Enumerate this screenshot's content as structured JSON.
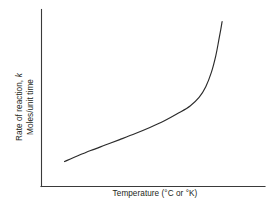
{
  "chart_data": {
    "type": "line",
    "title": "",
    "subtitle": "",
    "xlabel": "Temperature (°C or °K)",
    "ylabel_line1": "Rate of reaction, k",
    "ylabel_line1_plain": "Rate of reaction,",
    "ylabel_line1_symbol": "k",
    "ylabel_line2": "Moles/unit time",
    "ylabel_full": "Rate of reaction, k  Moles/unit time",
    "grid": false,
    "legend": "none",
    "xlim": [
      0,
      100
    ],
    "ylim": [
      0,
      100
    ],
    "xticks": [],
    "yticks": [],
    "xtick_labels": [],
    "ytick_labels": [],
    "annotations": [],
    "series": [
      {
        "name": "Rate of reaction vs temperature",
        "color": "#2b2b2b",
        "x": [
          10.3,
          16.0,
          22.0,
          28.5,
          35.0,
          42.0,
          48.5,
          55.0,
          61.5,
          66.5,
          70.5,
          73.5,
          76.0,
          78.0,
          79.3,
          80.2,
          80.8
        ],
        "y": [
          14.1,
          17.2,
          20.3,
          23.4,
          26.5,
          29.9,
          33.3,
          37.1,
          41.6,
          45.5,
          50.3,
          56.4,
          64.5,
          74.0,
          82.5,
          88.6,
          93.2
        ]
      }
    ]
  },
  "axes": {
    "y_axis_name": "y-axis",
    "x_axis_name": "x-axis"
  }
}
